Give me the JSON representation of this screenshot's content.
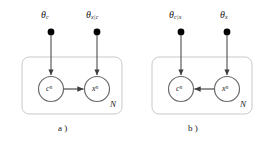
{
  "figure": {
    "type": "plate-notation-bayesian-network-pair",
    "background_color": "#ffffff",
    "stroke_color": "#4a4a4a",
    "plate_border_color": "#c8c8c8",
    "node_fill": "#ffffff",
    "dot_color": "#000000"
  },
  "panels": [
    {
      "id": "a",
      "caption": "a )",
      "parameters": [
        {
          "name": "theta-c",
          "symbol": "θ",
          "subscript": "c",
          "x": 46,
          "y": 15
        },
        {
          "name": "theta-x-given-c",
          "symbol": "θ",
          "subscript": "x|c",
          "x": 88,
          "y": 15
        }
      ],
      "nodes": [
        {
          "name": "node-c",
          "symbol": "c",
          "superscript": "n",
          "cx": 51,
          "cy": 89
        },
        {
          "name": "node-x",
          "symbol": "x",
          "superscript": "n",
          "cx": 97,
          "cy": 89
        }
      ],
      "edges": [
        {
          "name": "edge-theta-c-to-c",
          "from": "theta-c",
          "to": "node-c"
        },
        {
          "name": "edge-theta-x-given-c-to-x",
          "from": "theta-x-given-c",
          "to": "node-x"
        },
        {
          "name": "edge-c-to-x",
          "from": "node-c",
          "to": "node-x",
          "direction": "c-to-x"
        }
      ],
      "plate": {
        "label": "N",
        "x": 22,
        "y": 57,
        "width": 100,
        "height": 57
      }
    },
    {
      "id": "b",
      "caption": "b )",
      "parameters": [
        {
          "name": "theta-c-given-x",
          "symbol": "θ",
          "subscript": "c|x",
          "x": 46,
          "y": 15
        },
        {
          "name": "theta-x",
          "symbol": "θ",
          "subscript": "x",
          "x": 88,
          "y": 15
        }
      ],
      "nodes": [
        {
          "name": "node-c",
          "symbol": "c",
          "superscript": "n",
          "cx": 51,
          "cy": 89
        },
        {
          "name": "node-x",
          "symbol": "x",
          "superscript": "n",
          "cx": 97,
          "cy": 89
        }
      ],
      "edges": [
        {
          "name": "edge-theta-c-given-x-to-c",
          "from": "theta-c-given-x",
          "to": "node-c"
        },
        {
          "name": "edge-theta-x-to-x",
          "from": "theta-x",
          "to": "node-x"
        },
        {
          "name": "edge-x-to-c",
          "from": "node-x",
          "to": "node-c",
          "direction": "x-to-c"
        }
      ],
      "plate": {
        "label": "N",
        "x": 22,
        "y": 57,
        "width": 100,
        "height": 57
      }
    }
  ],
  "labels": {
    "panel_a": {
      "theta_left_symbol": "θ",
      "theta_left_sub": "c",
      "theta_right_symbol": "θ",
      "theta_right_sub": "x|c",
      "node_left_symbol": "c",
      "node_left_sup": "n",
      "node_right_symbol": "x",
      "node_right_sup": "n",
      "plate_label": "N",
      "caption": "a )"
    },
    "panel_b": {
      "theta_left_symbol": "θ",
      "theta_left_sub": "c|x",
      "theta_right_symbol": "θ",
      "theta_right_sub": "x",
      "node_left_symbol": "c",
      "node_left_sup": "n",
      "node_right_symbol": "x",
      "node_right_sup": "n",
      "plate_label": "N",
      "caption": "b )"
    }
  }
}
